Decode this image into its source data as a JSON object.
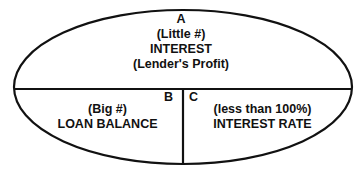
{
  "diagram": {
    "type": "interest-formula-ellipse",
    "colors": {
      "stroke": "#111111",
      "background": "#ffffff"
    },
    "sections": {
      "top": {
        "letter": "A",
        "subtitle": "(Little #)",
        "title": "INTEREST",
        "note": "(Lender's Profit)"
      },
      "bottom_left": {
        "letter": "B",
        "subtitle": "(Big #)",
        "title": "LOAN BALANCE"
      },
      "bottom_right": {
        "letter": "C",
        "subtitle": "(less than 100%)",
        "title": "INTEREST RATE"
      }
    }
  }
}
